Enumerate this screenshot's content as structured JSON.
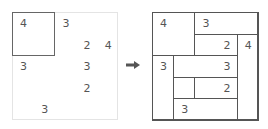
{
  "grid_size": 5,
  "cell_w": 21.2,
  "cell_h": 21.6,
  "arrow_color": "#555555",
  "puzzle": {
    "clues": [
      {
        "r": 0,
        "c": 0,
        "v": "4"
      },
      {
        "r": 0,
        "c": 2,
        "v": "3"
      },
      {
        "r": 1,
        "c": 3,
        "v": "2"
      },
      {
        "r": 1,
        "c": 4,
        "v": "4"
      },
      {
        "r": 2,
        "c": 0,
        "v": "3"
      },
      {
        "r": 2,
        "c": 3,
        "v": "3"
      },
      {
        "r": 3,
        "c": 3,
        "v": "2"
      },
      {
        "r": 4,
        "c": 1,
        "v": "3"
      }
    ],
    "highlight": {
      "r": 0,
      "c": 0,
      "rows": 2,
      "cols": 2
    }
  },
  "solution": {
    "regions": [
      {
        "r": 0,
        "c": 0,
        "rows": 2,
        "cols": 2,
        "label": "4",
        "label_r": 0,
        "label_c": 0
      },
      {
        "r": 0,
        "c": 2,
        "rows": 1,
        "cols": 3,
        "label": "3",
        "label_r": 0,
        "label_c": 2
      },
      {
        "r": 1,
        "c": 2,
        "rows": 1,
        "cols": 2,
        "label": "2",
        "label_r": 1,
        "label_c": 3
      },
      {
        "r": 1,
        "c": 4,
        "rows": 4,
        "cols": 1,
        "label": "4",
        "label_r": 1,
        "label_c": 4
      },
      {
        "r": 2,
        "c": 0,
        "rows": 3,
        "cols": 1,
        "label": "3",
        "label_r": 2,
        "label_c": 0
      },
      {
        "r": 2,
        "c": 1,
        "rows": 1,
        "cols": 3,
        "label": "3",
        "label_r": 2,
        "label_c": 3
      },
      {
        "r": 3,
        "c": 1,
        "rows": 1,
        "cols": 1,
        "label": "",
        "label_r": 3,
        "label_c": 1
      },
      {
        "r": 3,
        "c": 2,
        "rows": 1,
        "cols": 2,
        "label": "2",
        "label_r": 3,
        "label_c": 3
      },
      {
        "r": 4,
        "c": 1,
        "rows": 1,
        "cols": 3,
        "label": "3",
        "label_r": 4,
        "label_c": 1
      }
    ]
  }
}
